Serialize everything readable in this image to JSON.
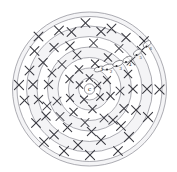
{
  "figure": {
    "center_label": "c",
    "background_color": "#ffffff",
    "ring_stroke_color": "#8a8a92",
    "mark_color": "#3b3b42",
    "shade_color": "#f4f4f6",
    "center": {
      "x": 89.5,
      "y": 89.0
    },
    "rings": [
      {
        "index": 1,
        "radius": 11.0
      },
      {
        "index": 2,
        "radius": 21.0
      },
      {
        "index": 3,
        "radius": 31.5
      },
      {
        "index": 4,
        "radius": 42.0
      },
      {
        "index": 5,
        "radius": 52.5
      },
      {
        "index": 6,
        "radius": 63.0
      },
      {
        "index": 7,
        "radius": 72.5
      },
      {
        "index": 8,
        "radius": 77.0
      }
    ],
    "numbered_markers": [
      {
        "label": "1",
        "x": 101.0,
        "y": 70.5,
        "dot_x": 98.6,
        "dot_y": 67.0
      },
      {
        "label": "2",
        "x": 110.0,
        "y": 73.0,
        "dot_x": 107.0,
        "dot_y": 69.5
      },
      {
        "label": "3",
        "x": 119.5,
        "y": 69.5,
        "dot_x": 116.5,
        "dot_y": 66.0
      },
      {
        "label": "4",
        "x": 129.0,
        "y": 65.5,
        "dot_x": 126.0,
        "dot_y": 62.0
      },
      {
        "label": "5",
        "x": 139.5,
        "y": 58.5,
        "dot_x": 136.5,
        "dot_y": 55.0
      },
      {
        "label": "6",
        "x": 149.5,
        "y": 50.0,
        "dot_x": 146.5,
        "dot_y": 46.5
      }
    ],
    "lens_shapes": [
      {
        "cx": 99.0,
        "cy": 69.0,
        "rx": 5.0,
        "ry": 2.4,
        "rot": -18
      },
      {
        "cx": 108.0,
        "cy": 67.0,
        "rx": 6.2,
        "ry": 2.6,
        "rot": -14
      },
      {
        "cx": 118.0,
        "cy": 63.5,
        "rx": 5.4,
        "ry": 2.6,
        "rot": -22
      },
      {
        "cx": 127.5,
        "cy": 59.5,
        "rx": 5.0,
        "ry": 2.5,
        "rot": -26
      },
      {
        "cx": 137.5,
        "cy": 52.5,
        "rx": 4.6,
        "ry": 2.4,
        "rot": -32
      },
      {
        "cx": 147.0,
        "cy": 44.0,
        "rx": 4.4,
        "ry": 2.4,
        "rot": -36
      }
    ],
    "x_markers": [
      {
        "x": 89.5,
        "y": 78.0,
        "size": 3.4
      },
      {
        "x": 79.5,
        "y": 85.0,
        "size": 3.4
      },
      {
        "x": 97.5,
        "y": 85.5,
        "size": 3.4
      },
      {
        "x": 84.0,
        "y": 99.5,
        "size": 3.6
      },
      {
        "x": 100.0,
        "y": 97.0,
        "size": 3.4
      },
      {
        "x": 79.0,
        "y": 69.5,
        "size": 3.8
      },
      {
        "x": 95.0,
        "y": 63.5,
        "size": 3.6
      },
      {
        "x": 69.5,
        "y": 79.0,
        "size": 3.8
      },
      {
        "x": 70.0,
        "y": 98.0,
        "size": 3.6
      },
      {
        "x": 92.5,
        "y": 109.0,
        "size": 3.8
      },
      {
        "x": 107.0,
        "y": 80.0,
        "size": 3.6
      },
      {
        "x": 110.5,
        "y": 96.0,
        "size": 3.8
      },
      {
        "x": 73.5,
        "y": 112.0,
        "size": 3.8
      },
      {
        "x": 62.0,
        "y": 64.5,
        "size": 4.0
      },
      {
        "x": 77.0,
        "y": 55.0,
        "size": 4.0
      },
      {
        "x": 108.0,
        "y": 57.5,
        "size": 3.8
      },
      {
        "x": 57.0,
        "y": 101.0,
        "size": 4.0
      },
      {
        "x": 120.0,
        "y": 91.0,
        "size": 4.0
      },
      {
        "x": 104.0,
        "y": 118.0,
        "size": 4.0
      },
      {
        "x": 85.0,
        "y": 122.5,
        "size": 4.0
      },
      {
        "x": 60.0,
        "y": 116.5,
        "size": 4.0
      },
      {
        "x": 48.5,
        "y": 84.5,
        "size": 4.2
      },
      {
        "x": 52.0,
        "y": 73.0,
        "size": 4.0
      },
      {
        "x": 70.0,
        "y": 46.0,
        "size": 4.2
      },
      {
        "x": 93.5,
        "y": 43.0,
        "size": 4.0
      },
      {
        "x": 119.0,
        "y": 48.5,
        "size": 4.0
      },
      {
        "x": 131.0,
        "y": 61.0,
        "size": 4.0
      },
      {
        "x": 133.0,
        "y": 89.0,
        "size": 4.2
      },
      {
        "x": 124.0,
        "y": 108.5,
        "size": 4.2
      },
      {
        "x": 113.0,
        "y": 120.0,
        "size": 4.2
      },
      {
        "x": 91.5,
        "y": 131.5,
        "size": 4.2
      },
      {
        "x": 67.5,
        "y": 127.5,
        "size": 4.2
      },
      {
        "x": 46.0,
        "y": 116.0,
        "size": 4.2
      },
      {
        "x": 38.5,
        "y": 99.5,
        "size": 4.2
      },
      {
        "x": 33.0,
        "y": 84.5,
        "size": 4.4
      },
      {
        "x": 43.0,
        "y": 62.5,
        "size": 4.2
      },
      {
        "x": 54.0,
        "y": 47.5,
        "size": 4.2
      },
      {
        "x": 71.5,
        "y": 32.0,
        "size": 4.4
      },
      {
        "x": 101.0,
        "y": 31.5,
        "size": 4.2
      },
      {
        "x": 126.0,
        "y": 37.5,
        "size": 4.2
      },
      {
        "x": 141.5,
        "y": 50.5,
        "size": 4.2
      },
      {
        "x": 147.0,
        "y": 89.0,
        "size": 4.4
      },
      {
        "x": 136.0,
        "y": 110.0,
        "size": 4.4
      },
      {
        "x": 121.0,
        "y": 126.0,
        "size": 4.4
      },
      {
        "x": 101.0,
        "y": 140.0,
        "size": 4.4
      },
      {
        "x": 78.0,
        "y": 145.0,
        "size": 4.4
      },
      {
        "x": 54.0,
        "y": 134.5,
        "size": 4.4
      },
      {
        "x": 36.0,
        "y": 123.0,
        "size": 4.4
      },
      {
        "x": 24.5,
        "y": 100.5,
        "size": 4.4
      },
      {
        "x": 19.0,
        "y": 85.0,
        "size": 4.6
      },
      {
        "x": 29.5,
        "y": 70.5,
        "size": 4.4
      },
      {
        "x": 34.5,
        "y": 51.0,
        "size": 4.4
      },
      {
        "x": 59.0,
        "y": 30.5,
        "size": 4.4
      },
      {
        "x": 85.5,
        "y": 23.0,
        "size": 4.4
      },
      {
        "x": 111.5,
        "y": 28.5,
        "size": 4.4
      },
      {
        "x": 144.0,
        "y": 41.0,
        "size": 4.4
      },
      {
        "x": 159.5,
        "y": 89.5,
        "size": 4.6
      },
      {
        "x": 148.0,
        "y": 117.0,
        "size": 4.6
      },
      {
        "x": 129.0,
        "y": 137.0,
        "size": 4.6
      },
      {
        "x": 90.0,
        "y": 155.0,
        "size": 4.6
      },
      {
        "x": 64.0,
        "y": 151.0,
        "size": 4.6
      },
      {
        "x": 118.0,
        "y": 151.0,
        "size": 4.4
      },
      {
        "x": 44.0,
        "y": 142.0,
        "size": 4.4
      },
      {
        "x": 38.5,
        "y": 36.5,
        "size": 4.4
      },
      {
        "x": 47.0,
        "y": 106.0,
        "size": 4.0
      },
      {
        "x": 128.0,
        "y": 74.0,
        "size": 3.8
      }
    ]
  }
}
